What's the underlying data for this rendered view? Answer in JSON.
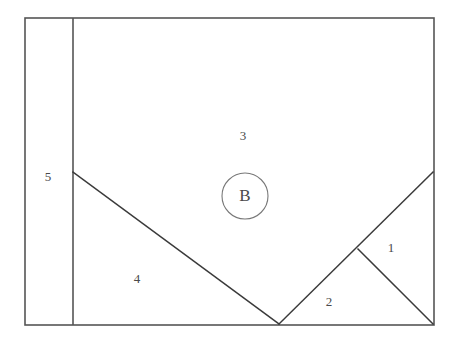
{
  "figure": {
    "background_color": "#ffffff",
    "line_color": "#3a3a3a",
    "outline_color": "#555555",
    "circle_color": "#787878",
    "label_color": "#4a4a4a",
    "outer_rect": {
      "x": 25,
      "y": 18,
      "width": 409,
      "height": 307
    },
    "divider": {
      "x": 73,
      "y1": 18,
      "y2": 325
    },
    "lines": [
      {
        "name": "left-diagonal",
        "x1": 73,
        "y1": 172,
        "x2": 279,
        "y2": 324
      },
      {
        "name": "right-diagonal",
        "x1": 279,
        "y1": 324,
        "x2": 433,
        "y2": 172
      },
      {
        "name": "short-diagonal",
        "x1": 358,
        "y1": 249,
        "x2": 433,
        "y2": 324
      }
    ],
    "circle": {
      "cx": 245,
      "cy": 196,
      "r": 23
    },
    "point_label": {
      "text": "B",
      "x": 245,
      "y": 197
    },
    "region_labels": [
      {
        "text": "1",
        "x": 391,
        "y": 249
      },
      {
        "text": "2",
        "x": 329,
        "y": 303
      },
      {
        "text": "3",
        "x": 243,
        "y": 137
      },
      {
        "text": "4",
        "x": 137,
        "y": 280
      },
      {
        "text": "5",
        "x": 48,
        "y": 178
      }
    ]
  }
}
